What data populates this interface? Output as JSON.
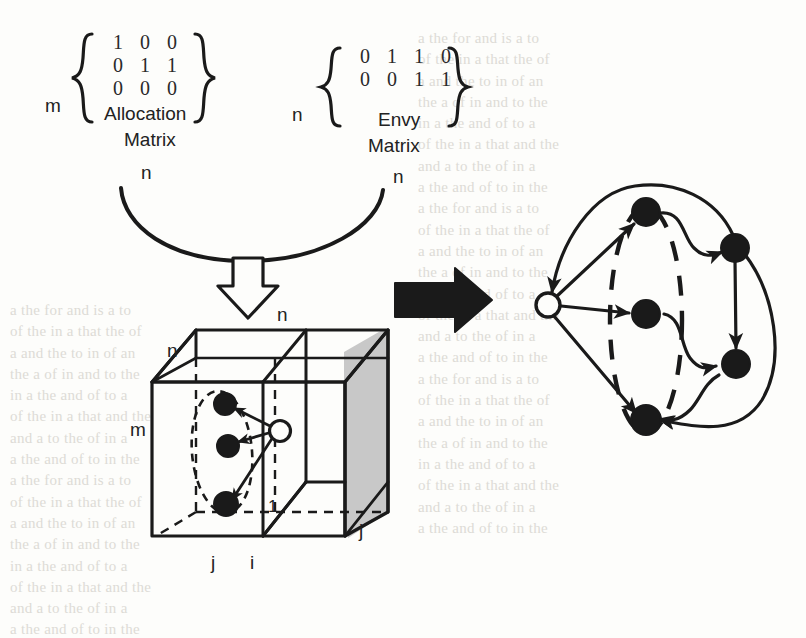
{
  "figure": {
    "ink_color": "#1a1a1a",
    "paper_color": "#fdfdfb",
    "shade_color": "#c8c8c8",
    "ghost_color": "#d8d6d0"
  },
  "allocation_matrix": {
    "name": "Allocation Matrix",
    "caption_line1": "Allocation",
    "caption_line2": "Matrix",
    "row_label": "m",
    "col_label": "n",
    "rows": [
      [
        "1",
        "0",
        "0"
      ],
      [
        "0",
        "1",
        "1"
      ],
      [
        "0",
        "0",
        "0"
      ]
    ]
  },
  "envy_matrix": {
    "name": "Envy Matrix",
    "caption_line1": "Envy",
    "caption_line2": "Matrix",
    "row_label": "n",
    "col_label": "n",
    "rows": [
      [
        "0",
        "1",
        "1",
        "0"
      ],
      [
        "0",
        "0",
        "1",
        "1"
      ]
    ]
  },
  "merge_arrow": {
    "label": "",
    "style": "hollow-outline-down"
  },
  "transform_arrow": {
    "label": "",
    "style": "solid-black-right"
  },
  "cube": {
    "label_top_back": "n",
    "label_top_left": "n",
    "label_left": "m",
    "label_bottom_left": "j",
    "label_bottom_mid": "i",
    "label_right": "j",
    "label_inner": "1",
    "nodes": [
      {
        "id": "a",
        "type": "filled"
      },
      {
        "id": "b",
        "type": "filled"
      },
      {
        "id": "c",
        "type": "filled"
      },
      {
        "id": "r",
        "type": "hollow"
      }
    ],
    "edges": [
      {
        "from": "r",
        "to": "a"
      },
      {
        "from": "r",
        "to": "b"
      },
      {
        "from": "r",
        "to": "c"
      }
    ],
    "group_shape": "dashed-ellipse"
  },
  "graph": {
    "nodes": [
      {
        "id": "root",
        "type": "hollow"
      },
      {
        "id": "n1",
        "type": "filled"
      },
      {
        "id": "n2",
        "type": "filled"
      },
      {
        "id": "n3",
        "type": "filled"
      },
      {
        "id": "n4",
        "type": "filled"
      },
      {
        "id": "n5",
        "type": "filled"
      }
    ],
    "edges": [
      {
        "from": "root",
        "to": "n1"
      },
      {
        "from": "root",
        "to": "n2"
      },
      {
        "from": "root",
        "to": "n3"
      },
      {
        "from": "n1",
        "to": "n4"
      },
      {
        "from": "n2",
        "to": "n5"
      },
      {
        "from": "n4",
        "to": "n5"
      },
      {
        "from": "n5",
        "to": "n3"
      },
      {
        "from": "n4",
        "to": "root"
      },
      {
        "from": "n3",
        "to": "n1"
      }
    ],
    "group_shape": "dashed-ellipse"
  },
  "background_text": {
    "note": "faint show-through from reverse page, illegible",
    "lines": [
      "a    the    for    and    is    a    to",
      "of the    in    a    that    the    of",
      "a    and    the    to    in    of    an",
      "the    a    of    in    and    to    the",
      "in    a    the    and    of    to    a",
      "of    the    in    a    that    and    the",
      "and    a    to    the    of    in    a",
      "a    the    and    of    to    in    the"
    ]
  }
}
